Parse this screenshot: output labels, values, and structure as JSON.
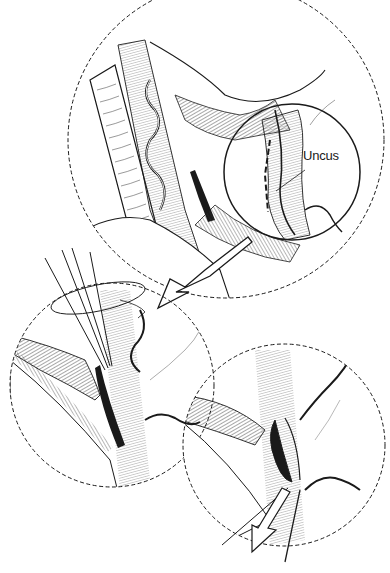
{
  "figure": {
    "type": "surgical-illustration",
    "panels": [
      {
        "id": "top",
        "description": "Overview view with magnified inset circle"
      },
      {
        "id": "middle-left",
        "description": "Instrument with rotation indicator"
      },
      {
        "id": "bottom-right",
        "description": "Resection with directional arrow"
      }
    ],
    "labels": {
      "uncus": "Uncus"
    },
    "colors": {
      "ink": "#1a1a1a",
      "background": "#ffffff"
    }
  }
}
